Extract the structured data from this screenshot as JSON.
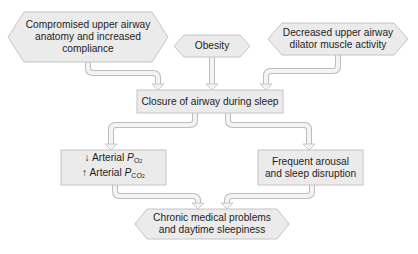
{
  "colors": {
    "box_fill": "#ebebeb",
    "box_stroke": "#c4c4c4",
    "arrow_fill": "#f4f4f4",
    "arrow_stroke": "#bdbdbd",
    "text": "#1e1e1e"
  },
  "nodes": {
    "upper_anatomy": {
      "shape": "hexagon",
      "lines": [
        "Compromised upper airway",
        "anatomy and increased",
        "compliance"
      ]
    },
    "obesity": {
      "shape": "hexagon",
      "lines": [
        "Obesity"
      ]
    },
    "dilator_muscle": {
      "shape": "hexagon",
      "lines": [
        "Decreased upper airway",
        "dilator muscle activity"
      ]
    },
    "closure": {
      "shape": "rectangle",
      "lines": [
        "Closure of airway during sleep"
      ]
    },
    "arterial": {
      "shape": "rectangle",
      "line1": {
        "arrow": "↓",
        "text": "Arterial",
        "var": "P",
        "sub": "O",
        "subsub": "2"
      },
      "line2": {
        "arrow": "↑",
        "text": "Arterial",
        "var": "P",
        "sub": "CO",
        "subsub": "2"
      }
    },
    "arousal": {
      "shape": "rectangle",
      "lines": [
        "Frequent arousal",
        "and sleep disruption"
      ]
    },
    "chronic": {
      "shape": "hexagon",
      "lines": [
        "Chronic medical problems",
        "and daytime sleepiness"
      ]
    }
  },
  "edges": [
    {
      "from": "upper_anatomy",
      "to": "closure"
    },
    {
      "from": "obesity",
      "to": "closure"
    },
    {
      "from": "dilator_muscle",
      "to": "closure"
    },
    {
      "from": "closure",
      "to": "arterial"
    },
    {
      "from": "closure",
      "to": "arousal"
    },
    {
      "from": "arterial",
      "to": "chronic"
    },
    {
      "from": "arousal",
      "to": "chronic"
    }
  ]
}
